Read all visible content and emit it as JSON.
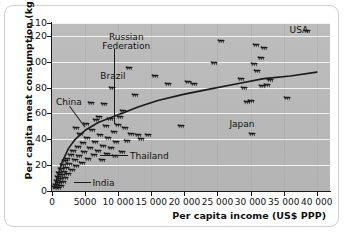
{
  "chart_data": {
    "type": "scatter",
    "title": "",
    "xlabel": "Per capita income (US$ PPP)",
    "ylabel": "Per capita meat consumption (kg)",
    "xlim": [
      0,
      42000
    ],
    "ylim": [
      0,
      130
    ],
    "grid": "horizontal white gridlines, faint vertical gridlines",
    "legend": "none",
    "marker": "cattle-silhouette",
    "xticks": [
      "0",
      "5000",
      "10 000",
      "15 000",
      "20 000",
      "25 000",
      "30 000",
      "35 000",
      "40 000"
    ],
    "xtick_values": [
      0,
      5000,
      10000,
      15000,
      20000,
      25000,
      30000,
      35000,
      40000
    ],
    "yticks": [
      "110",
      "120",
      "100",
      "80",
      "60",
      "40",
      "20",
      "0"
    ],
    "ytick_values": [
      130,
      120,
      100,
      80,
      60,
      40,
      20,
      0
    ],
    "trend_curve": {
      "description": "logarithmic fit rising steeply then flattening",
      "points": [
        [
          300,
          2
        ],
        [
          800,
          10
        ],
        [
          1500,
          22
        ],
        [
          2500,
          33
        ],
        [
          3500,
          40
        ],
        [
          5000,
          47
        ],
        [
          7000,
          53
        ],
        [
          9000,
          57
        ],
        [
          11000,
          61
        ],
        [
          13000,
          65
        ],
        [
          16000,
          70
        ],
        [
          20000,
          75
        ],
        [
          24000,
          79
        ],
        [
          28000,
          83
        ],
        [
          32000,
          87
        ],
        [
          36000,
          89
        ],
        [
          40000,
          92
        ]
      ]
    },
    "points": [
      [
        400,
        3
      ],
      [
        600,
        5
      ],
      [
        700,
        8
      ],
      [
        850,
        2
      ],
      [
        900,
        11
      ],
      [
        1000,
        6
      ],
      [
        1100,
        14
      ],
      [
        1200,
        9
      ],
      [
        1300,
        17
      ],
      [
        1400,
        4
      ],
      [
        1500,
        12
      ],
      [
        1600,
        20
      ],
      [
        1700,
        7
      ],
      [
        1800,
        15
      ],
      [
        1900,
        23
      ],
      [
        2000,
        10
      ],
      [
        2100,
        18
      ],
      [
        2300,
        25
      ],
      [
        2400,
        13
      ],
      [
        2600,
        21
      ],
      [
        2800,
        28
      ],
      [
        3000,
        16
      ],
      [
        3200,
        31
      ],
      [
        3400,
        24
      ],
      [
        3600,
        49
      ],
      [
        3700,
        19
      ],
      [
        3900,
        34
      ],
      [
        4100,
        27
      ],
      [
        4300,
        44
      ],
      [
        4500,
        22
      ],
      [
        4700,
        37
      ],
      [
        4900,
        30
      ],
      [
        5100,
        52
      ],
      [
        5300,
        41
      ],
      [
        5500,
        25
      ],
      [
        5700,
        33
      ],
      [
        5900,
        68
      ],
      [
        6100,
        47
      ],
      [
        6300,
        28
      ],
      [
        6500,
        38
      ],
      [
        6700,
        55
      ],
      [
        6900,
        31
      ],
      [
        7100,
        57
      ],
      [
        7300,
        43
      ],
      [
        7500,
        24
      ],
      [
        7700,
        35
      ],
      [
        7900,
        67
      ],
      [
        8100,
        50
      ],
      [
        8300,
        29
      ],
      [
        8500,
        41
      ],
      [
        8700,
        56
      ],
      [
        8900,
        33
      ],
      [
        9100,
        80
      ],
      [
        9300,
        46
      ],
      [
        9500,
        27
      ],
      [
        9700,
        38
      ],
      [
        9900,
        51
      ],
      [
        10200,
        57
      ],
      [
        10500,
        30
      ],
      [
        10800,
        62
      ],
      [
        11000,
        49
      ],
      [
        11300,
        39
      ],
      [
        11700,
        95
      ],
      [
        12000,
        44
      ],
      [
        12500,
        74
      ],
      [
        13000,
        43
      ],
      [
        13500,
        40
      ],
      [
        14500,
        43
      ],
      [
        15500,
        89
      ],
      [
        17500,
        83
      ],
      [
        19500,
        50
      ],
      [
        20500,
        84
      ],
      [
        21500,
        83
      ],
      [
        24500,
        99
      ],
      [
        25500,
        116
      ],
      [
        28500,
        87
      ],
      [
        29000,
        80
      ],
      [
        29500,
        69
      ],
      [
        30000,
        70
      ],
      [
        30500,
        98
      ],
      [
        30800,
        113
      ],
      [
        31000,
        93
      ],
      [
        31500,
        103
      ],
      [
        31800,
        81
      ],
      [
        32000,
        111
      ],
      [
        32500,
        82
      ],
      [
        33000,
        86
      ],
      [
        30200,
        44
      ],
      [
        35500,
        72
      ],
      [
        38500,
        124
      ]
    ],
    "annotations": [
      {
        "label": "USA",
        "x": 38500,
        "y": 124
      },
      {
        "label": "Russian Federation",
        "x": 9300,
        "y": 46
      },
      {
        "label": "Brazil",
        "x": 9100,
        "y": 80
      },
      {
        "label": "China",
        "x": 5100,
        "y": 52
      },
      {
        "label": "Thailand",
        "x": 5900,
        "y": 26
      },
      {
        "label": "India",
        "x": 2200,
        "y": 5
      },
      {
        "label": "Japan",
        "x": 30200,
        "y": 44
      }
    ]
  },
  "axes": {
    "y_title": "Per capita meat consumption (kg)",
    "x_title": "Per capita income (US$ PPP)",
    "y_labels": [
      "110",
      "120",
      "100",
      "80",
      "60",
      "40",
      "20",
      "0"
    ],
    "x_labels": [
      "0",
      "5000",
      "10 000",
      "15 000",
      "20 000",
      "25 000",
      "30 000",
      "35 000",
      "40 000"
    ]
  },
  "labels": {
    "usa": "USA",
    "russian_federation_line1": "Russian",
    "russian_federation_line2": "Federation",
    "brazil": "Brazil",
    "china": "China",
    "thailand": "Thailand",
    "india": "India",
    "japan": "Japan"
  },
  "colors": {
    "plot_background": "#b9b9b9",
    "gridline": "#f2f2f2",
    "axis": "#1a1a1a",
    "marker": "#1a1a1a",
    "curve": "#1a1a1a",
    "card_border": "#cfcfcf",
    "page_background": "#ffffff"
  }
}
